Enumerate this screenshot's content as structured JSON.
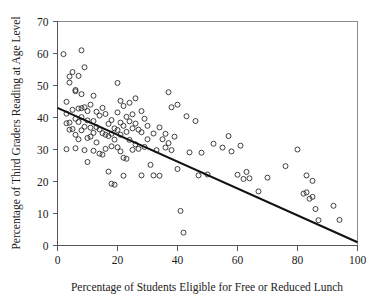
{
  "chart_data": {
    "type": "scatter",
    "title": "",
    "xlabel": "Percentage of Students Eligible for Free or Reduced Lunch",
    "ylabel": "Percentage of Third Graders Reading at Age Level",
    "xlim": [
      0,
      100
    ],
    "ylim": [
      0,
      70
    ],
    "xticks": [
      0,
      20,
      40,
      60,
      80,
      100
    ],
    "yticks": [
      0,
      10,
      20,
      30,
      40,
      50,
      60,
      70
    ],
    "xtick_labels": [
      "0",
      "20",
      "40",
      "60",
      "80",
      "100"
    ],
    "ytick_labels": [
      "0",
      "10",
      "20",
      "30",
      "40",
      "50",
      "60",
      "70"
    ],
    "grid": false,
    "legend": null,
    "marker": "open-circle",
    "marker_color": "#2b2b30",
    "trendline": {
      "type": "linear",
      "color": "#121214",
      "x_start": 0,
      "y_start": 43,
      "x_end": 100,
      "y_end": 1
    },
    "points": [
      [
        2,
        59.8
      ],
      [
        3,
        44.9
      ],
      [
        3,
        41.2
      ],
      [
        3,
        38.2
      ],
      [
        3,
        30.1
      ],
      [
        4,
        52.8
      ],
      [
        4,
        50.9
      ],
      [
        4,
        38.4
      ],
      [
        4,
        36.2
      ],
      [
        5,
        54.2
      ],
      [
        5,
        42.4
      ],
      [
        5,
        36.4
      ],
      [
        6,
        48.6
      ],
      [
        6,
        48.2
      ],
      [
        6,
        39.6
      ],
      [
        6,
        34.6
      ],
      [
        6,
        30.4
      ],
      [
        7,
        53.0
      ],
      [
        7,
        42.8
      ],
      [
        7,
        38.6
      ],
      [
        7,
        33.2
      ],
      [
        8,
        61.0
      ],
      [
        8,
        47.3
      ],
      [
        8,
        42.9
      ],
      [
        8,
        40.1
      ],
      [
        8,
        36.0
      ],
      [
        9,
        55.7
      ],
      [
        9,
        43.2
      ],
      [
        9,
        37.1
      ],
      [
        9,
        29.8
      ],
      [
        10,
        42.0
      ],
      [
        10,
        39.1
      ],
      [
        10,
        33.6
      ],
      [
        10,
        26.1
      ],
      [
        11,
        44.0
      ],
      [
        11,
        36.8
      ],
      [
        11,
        34.0
      ],
      [
        12,
        46.8
      ],
      [
        12,
        38.9
      ],
      [
        12,
        35.2
      ],
      [
        12,
        29.6
      ],
      [
        13,
        41.8
      ],
      [
        13,
        37.0
      ],
      [
        13,
        32.2
      ],
      [
        14,
        40.6
      ],
      [
        14,
        36.3
      ],
      [
        14,
        28.7
      ],
      [
        15,
        43.0
      ],
      [
        15,
        35.1
      ],
      [
        15,
        28.4
      ],
      [
        16,
        41.1
      ],
      [
        16,
        34.6
      ],
      [
        16,
        30.2
      ],
      [
        17,
        38.0
      ],
      [
        17,
        34.2
      ],
      [
        17,
        23.1
      ],
      [
        18,
        39.2
      ],
      [
        18,
        34.9
      ],
      [
        18,
        31.0
      ],
      [
        18,
        19.3
      ],
      [
        19,
        36.6
      ],
      [
        19,
        33.1
      ],
      [
        19,
        19.0
      ],
      [
        20,
        50.8
      ],
      [
        20,
        41.6
      ],
      [
        20,
        36.1
      ],
      [
        20,
        30.7
      ],
      [
        21,
        45.2
      ],
      [
        21,
        38.4
      ],
      [
        21,
        34.6
      ],
      [
        21,
        29.4
      ],
      [
        22,
        43.6
      ],
      [
        22,
        37.4
      ],
      [
        22,
        27.4
      ],
      [
        22,
        21.8
      ],
      [
        23,
        40.2
      ],
      [
        23,
        35.5
      ],
      [
        23,
        27.1
      ],
      [
        24,
        44.6
      ],
      [
        24,
        38.8
      ],
      [
        24,
        33.0
      ],
      [
        25,
        41.0
      ],
      [
        25,
        36.6
      ],
      [
        25,
        29.9
      ],
      [
        26,
        46.0
      ],
      [
        26,
        38.1
      ],
      [
        26,
        31.6
      ],
      [
        27,
        36.2
      ],
      [
        27,
        30.2
      ],
      [
        28,
        42.0
      ],
      [
        28,
        35.4
      ],
      [
        28,
        21.9
      ],
      [
        29,
        39.6
      ],
      [
        29,
        30.8
      ],
      [
        30,
        37.4
      ],
      [
        30,
        33.2
      ],
      [
        31,
        25.2
      ],
      [
        32,
        35.0
      ],
      [
        32,
        21.9
      ],
      [
        33,
        29.8
      ],
      [
        34,
        36.9
      ],
      [
        34,
        21.8
      ],
      [
        35,
        33.2
      ],
      [
        36,
        34.9
      ],
      [
        36,
        30.6
      ],
      [
        37,
        47.9
      ],
      [
        37,
        32.0
      ],
      [
        38,
        43.2
      ],
      [
        38,
        29.8
      ],
      [
        39,
        34.0
      ],
      [
        40,
        44.0
      ],
      [
        40,
        23.9
      ],
      [
        41,
        10.8
      ],
      [
        42,
        4.0
      ],
      [
        43,
        40.4
      ],
      [
        44,
        29.1
      ],
      [
        46,
        38.9
      ],
      [
        47,
        21.9
      ],
      [
        48,
        29.0
      ],
      [
        50,
        22.2
      ],
      [
        52,
        31.8
      ],
      [
        55,
        30.6
      ],
      [
        57,
        34.2
      ],
      [
        58,
        29.4
      ],
      [
        60,
        22.1
      ],
      [
        61,
        31.2
      ],
      [
        62,
        20.8
      ],
      [
        63,
        23.0
      ],
      [
        64,
        21.0
      ],
      [
        67,
        16.9
      ],
      [
        70,
        21.2
      ],
      [
        76,
        24.8
      ],
      [
        80,
        30.0
      ],
      [
        82,
        16.2
      ],
      [
        83,
        21.9
      ],
      [
        83,
        16.6
      ],
      [
        84,
        14.6
      ],
      [
        85,
        20.2
      ],
      [
        85,
        15.2
      ],
      [
        86,
        11.4
      ],
      [
        87,
        7.9
      ],
      [
        92,
        12.4
      ],
      [
        94,
        8.0
      ]
    ]
  }
}
